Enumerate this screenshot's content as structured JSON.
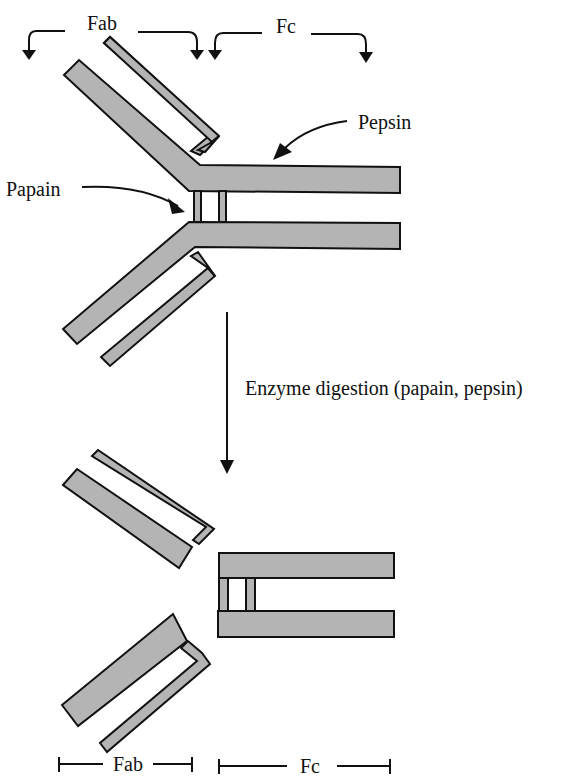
{
  "figure": {
    "clipped_caption": "",
    "top": {
      "fab_label": "Fab",
      "fc_label": "Fc",
      "papain_label": "Papain",
      "pepsin_label": "Pepsin"
    },
    "process": {
      "step_label": "Enzyme digestion (papain, pepsin)"
    },
    "bottom": {
      "fab_label": "Fab",
      "fc_label": "Fc"
    },
    "colors": {
      "chain_fill": "#b4b4b4",
      "outline": "#111111",
      "background": "#ffffff"
    }
  }
}
